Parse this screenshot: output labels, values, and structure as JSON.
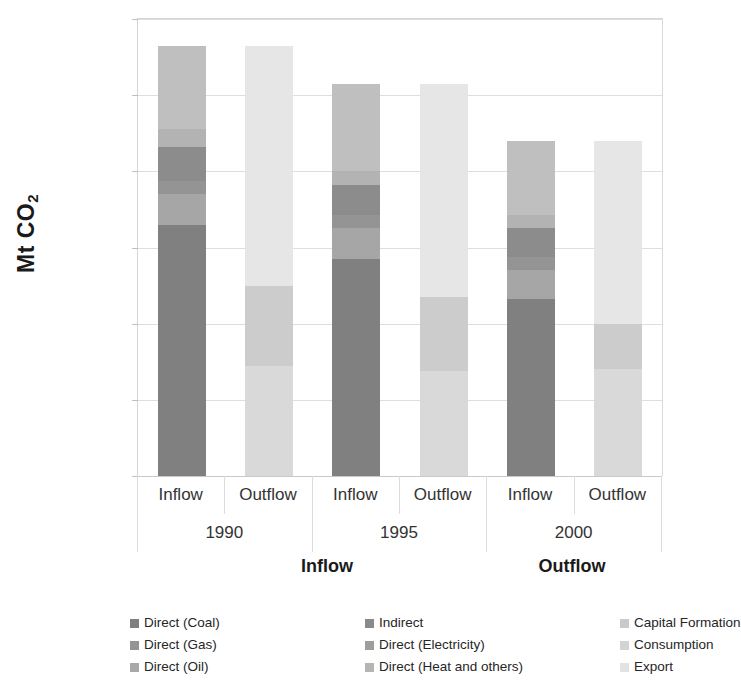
{
  "chart_data": {
    "type": "bar",
    "subtype": "stacked-grouped",
    "title": "",
    "xlabel": "",
    "ylabel": "Mt CO2",
    "ylabel_display": "Mt CO",
    "ylabel_sub": "2",
    "ylim": [
      0,
      120000
    ],
    "ytick_values": [
      0,
      20000,
      40000,
      60000,
      80000,
      100000,
      120000
    ],
    "ytick_labels": [
      "0",
      "20,000",
      "40,000",
      "60,000",
      "80,000",
      "100,000",
      "120,000"
    ],
    "grid": true,
    "legend_position": "bottom",
    "group_titles": [
      "Inflow",
      "Outflow"
    ],
    "year_categories": [
      "1990",
      "1995",
      "2000"
    ],
    "flow_categories": [
      "Inflow",
      "Outflow"
    ],
    "series": [
      {
        "name": "Direct (Coal)",
        "color": "#808080",
        "stack": "Inflow",
        "values": [
          66000,
          57000,
          46500
        ]
      },
      {
        "name": "Direct (Oil)",
        "color": "#A6A6A6",
        "stack": "Inflow",
        "values": [
          8000,
          8000,
          7500
        ]
      },
      {
        "name": "Direct (Gas)",
        "color": "#949494",
        "stack": "Inflow",
        "values": [
          3500,
          3500,
          3500
        ]
      },
      {
        "name": "Direct (Electricity)",
        "color": "#8C8C8C",
        "stack": "Inflow",
        "values": [
          9000,
          9500,
          7000
        ]
      },
      {
        "name": "Direct (Heat and others)",
        "color": "#B3B3B3",
        "stack": "Inflow",
        "values": [
          4500,
          3000,
          3500
        ]
      },
      {
        "name": "Indirect",
        "color": "#BFBFBF",
        "stack": "Inflow",
        "values": [
          17000,
          13500,
          14000
        ]
      },
      {
        "name": "Capital Formation",
        "color": "#D9D9D9",
        "stack": "Outflow",
        "values": [
          29000,
          27500,
          28000
        ]
      },
      {
        "name": "Consumption",
        "color": "#CCCCCC",
        "stack": "Outflow",
        "values": [
          21000,
          19500,
          12000
        ]
      },
      {
        "name": "Export",
        "color": "#E6E6E6",
        "stack": "Outflow",
        "values": [
          63000,
          56000,
          48000
        ]
      }
    ],
    "stacks": {
      "1990": {
        "Inflow": {
          "total": 113000,
          "segments": [
            {
              "name": "Direct (Coal)",
              "value": 66000,
              "color": "#808080"
            },
            {
              "name": "Direct (Oil)",
              "value": 8000,
              "color": "#A6A6A6"
            },
            {
              "name": "Direct (Gas)",
              "value": 3500,
              "color": "#949494"
            },
            {
              "name": "Direct (Electricity)",
              "value": 9000,
              "color": "#8C8C8C"
            },
            {
              "name": "Direct (Heat and others)",
              "value": 4500,
              "color": "#B3B3B3"
            },
            {
              "name": "Indirect",
              "value": 22000,
              "color": "#BFBFBF"
            }
          ]
        },
        "Outflow": {
          "total": 113000,
          "segments": [
            {
              "name": "Capital Formation",
              "value": 29000,
              "color": "#D9D9D9"
            },
            {
              "name": "Consumption",
              "value": 21000,
              "color": "#CCCCCC"
            },
            {
              "name": "Export",
              "value": 63000,
              "color": "#E6E6E6"
            }
          ]
        }
      },
      "1995": {
        "Inflow": {
          "total": 103000,
          "segments": [
            {
              "name": "Direct (Coal)",
              "value": 57000,
              "color": "#808080"
            },
            {
              "name": "Direct (Oil)",
              "value": 8000,
              "color": "#A6A6A6"
            },
            {
              "name": "Direct (Gas)",
              "value": 3500,
              "color": "#949494"
            },
            {
              "name": "Direct (Electricity)",
              "value": 8000,
              "color": "#8C8C8C"
            },
            {
              "name": "Direct (Heat and others)",
              "value": 3500,
              "color": "#B3B3B3"
            },
            {
              "name": "Indirect",
              "value": 23000,
              "color": "#BFBFBF"
            }
          ]
        },
        "Outflow": {
          "total": 103000,
          "segments": [
            {
              "name": "Capital Formation",
              "value": 27500,
              "color": "#D9D9D9"
            },
            {
              "name": "Consumption",
              "value": 19500,
              "color": "#CCCCCC"
            },
            {
              "name": "Export",
              "value": 56000,
              "color": "#E6E6E6"
            }
          ]
        }
      },
      "2000": {
        "Inflow": {
          "total": 88000,
          "segments": [
            {
              "name": "Direct (Coal)",
              "value": 46500,
              "color": "#808080"
            },
            {
              "name": "Direct (Oil)",
              "value": 7500,
              "color": "#A6A6A6"
            },
            {
              "name": "Direct (Gas)",
              "value": 3500,
              "color": "#949494"
            },
            {
              "name": "Direct (Electricity)",
              "value": 7500,
              "color": "#8C8C8C"
            },
            {
              "name": "Direct (Heat and others)",
              "value": 3500,
              "color": "#B3B3B3"
            },
            {
              "name": "Indirect",
              "value": 19500,
              "color": "#BFBFBF"
            }
          ]
        },
        "Outflow": {
          "total": 88000,
          "segments": [
            {
              "name": "Capital Formation",
              "value": 28000,
              "color": "#D9D9D9"
            },
            {
              "name": "Consumption",
              "value": 12000,
              "color": "#CCCCCC"
            },
            {
              "name": "Export",
              "value": 48000,
              "color": "#E6E6E6"
            }
          ]
        }
      }
    },
    "legend": {
      "columns": [
        [
          {
            "label": "Direct (Coal)",
            "color": "#7F7F7F"
          },
          {
            "label": "Direct (Gas)",
            "color": "#949494"
          },
          {
            "label": "Direct (Oil)",
            "color": "#A9A9A9"
          }
        ],
        [
          {
            "label": "Indirect",
            "color": "#8A8A8A"
          },
          {
            "label": "Direct (Electricity)",
            "color": "#9E9E9E"
          },
          {
            "label": "Direct (Heat and others)",
            "color": "#B5B5B5"
          }
        ],
        [
          {
            "label": "Capital Formation",
            "color": "#C9C9C9"
          },
          {
            "label": "Consumption",
            "color": "#D3D3D3"
          },
          {
            "label": "Export",
            "color": "#E2E2E2"
          }
        ]
      ]
    }
  }
}
